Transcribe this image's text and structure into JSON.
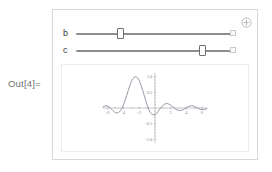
{
  "notebook": {
    "out_label": "Out[4]="
  },
  "manipulate": {
    "controls": [
      {
        "label": "b",
        "thumb_percent": 28,
        "reset_button": "slider-reset-square"
      },
      {
        "label": "c",
        "thumb_percent": 79,
        "reset_button": "slider-reset-square"
      }
    ],
    "plus_button": "plus-circle-icon",
    "colors": {
      "frame_border": "#d8d8d8",
      "panel_border": "#ededed",
      "slider_track": "#8d8d8d",
      "slider_thumb_border": "#6e6e6e",
      "curve": "#7a7f96",
      "axis": "#9a9a9a",
      "tick_text": "#8a8a8a",
      "out_label": "#707070"
    }
  },
  "chart_data": {
    "type": "line",
    "title": "",
    "xlabel": "",
    "ylabel": "",
    "xlim": [
      -6.6,
      6.6
    ],
    "ylim": [
      -1.12,
      1.12
    ],
    "grid": false,
    "legend": null,
    "xticks": [
      -6,
      -4,
      -2,
      2,
      4,
      6
    ],
    "xtick_labels": [
      "-6",
      "-4",
      "-2",
      "2",
      "4",
      "6"
    ],
    "yticks": [
      1.0,
      0.5,
      -0.5,
      -1.0
    ],
    "ytick_labels": [
      "1.0",
      "0.5",
      "-0.5",
      "-1.0"
    ],
    "series": [
      {
        "name": "f(x)",
        "x": [
          -6.6,
          -6.4,
          -6.2,
          -6.0,
          -5.8,
          -5.6,
          -5.4,
          -5.2,
          -5.0,
          -4.8,
          -4.6,
          -4.4,
          -4.2,
          -4.0,
          -3.8,
          -3.6,
          -3.4,
          -3.2,
          -3.0,
          -2.8,
          -2.6,
          -2.4,
          -2.2,
          -2.0,
          -1.8,
          -1.6,
          -1.4,
          -1.2,
          -1.0,
          -0.8,
          -0.6,
          -0.4,
          -0.2,
          0.0,
          0.2,
          0.4,
          0.6,
          0.8,
          1.0,
          1.2,
          1.4,
          1.6,
          1.8,
          2.0,
          2.2,
          2.4,
          2.6,
          2.8,
          3.0,
          3.2,
          3.4,
          3.6,
          3.8,
          4.0,
          4.2,
          4.4,
          4.6,
          4.8,
          5.0,
          5.2,
          5.4,
          5.6,
          5.8,
          6.0,
          6.2,
          6.4,
          6.6
        ],
        "y": [
          0.03,
          0.06,
          0.07,
          0.06,
          0.03,
          -0.02,
          -0.07,
          -0.12,
          -0.15,
          -0.16,
          -0.14,
          -0.09,
          -0.01,
          0.1,
          0.24,
          0.4,
          0.56,
          0.71,
          0.85,
          0.94,
          0.99,
          1.0,
          0.96,
          0.88,
          0.75,
          0.6,
          0.43,
          0.26,
          0.1,
          -0.04,
          -0.14,
          -0.2,
          -0.22,
          -0.21,
          -0.17,
          -0.11,
          -0.04,
          0.03,
          0.08,
          0.12,
          0.14,
          0.14,
          0.12,
          0.09,
          0.05,
          0.01,
          -0.03,
          -0.06,
          -0.08,
          -0.08,
          -0.07,
          -0.05,
          -0.02,
          0.01,
          0.04,
          0.06,
          0.07,
          0.07,
          0.05,
          0.03,
          0.0,
          -0.02,
          -0.04,
          -0.05,
          -0.05,
          -0.04,
          -0.02
        ]
      }
    ]
  }
}
